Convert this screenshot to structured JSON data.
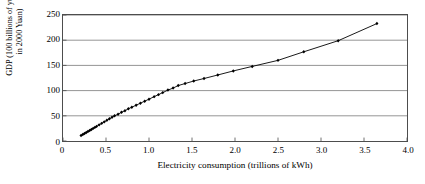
{
  "chart_data": {
    "type": "scatter",
    "title": "",
    "xlabel": "Electricity consumption (trillions of kWh)",
    "ylabel_line1": "GDP (100 billions of yuan,",
    "ylabel_line2": "in 2000 Yuan)",
    "xlim": [
      0,
      4.0
    ],
    "ylim": [
      0,
      250
    ],
    "xticks": [
      "0",
      "0.5",
      "1.0",
      "1.5",
      "2.0",
      "2.5",
      "3.0",
      "3.5",
      "4.0"
    ],
    "xtick_values": [
      0,
      0.5,
      1.0,
      1.5,
      2.0,
      2.5,
      3.0,
      3.5,
      4.0
    ],
    "yticks": [
      "0",
      "50",
      "100",
      "150",
      "200",
      "250"
    ],
    "ytick_values": [
      0,
      50,
      100,
      150,
      200,
      250
    ],
    "grid": "horizontal",
    "legend": "none",
    "marker": "filled-diamond",
    "connector": "solid-line",
    "series": [
      {
        "name": "GDP vs electricity consumption",
        "points": [
          [
            0.21,
            11
          ],
          [
            0.23,
            13
          ],
          [
            0.25,
            15
          ],
          [
            0.27,
            17
          ],
          [
            0.29,
            19
          ],
          [
            0.31,
            21
          ],
          [
            0.33,
            23
          ],
          [
            0.35,
            25
          ],
          [
            0.37,
            27
          ],
          [
            0.39,
            29
          ],
          [
            0.42,
            32
          ],
          [
            0.45,
            35
          ],
          [
            0.48,
            38
          ],
          [
            0.51,
            41
          ],
          [
            0.54,
            44
          ],
          [
            0.57,
            47
          ],
          [
            0.6,
            50
          ],
          [
            0.64,
            53
          ],
          [
            0.68,
            57
          ],
          [
            0.72,
            60
          ],
          [
            0.76,
            64
          ],
          [
            0.8,
            67
          ],
          [
            0.85,
            71
          ],
          [
            0.9,
            75
          ],
          [
            0.95,
            79
          ],
          [
            1.0,
            83
          ],
          [
            1.06,
            88
          ],
          [
            1.11,
            92
          ],
          [
            1.16,
            96
          ],
          [
            1.22,
            101
          ],
          [
            1.28,
            105
          ],
          [
            1.34,
            110
          ],
          [
            1.42,
            114
          ],
          [
            1.52,
            119
          ],
          [
            1.64,
            124
          ],
          [
            1.8,
            131
          ],
          [
            1.98,
            139
          ],
          [
            2.2,
            148
          ],
          [
            2.5,
            160
          ],
          [
            2.8,
            177
          ],
          [
            3.2,
            199
          ],
          [
            3.65,
            233
          ]
        ]
      }
    ]
  }
}
